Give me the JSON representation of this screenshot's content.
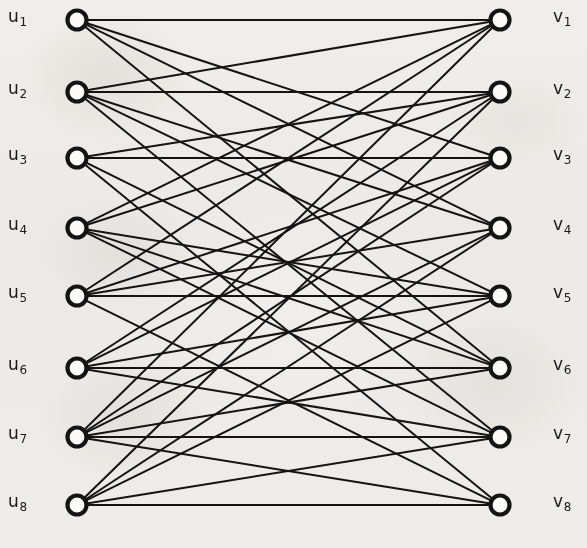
{
  "figure": {
    "kind": "bipartite-graph",
    "background_color": "#f7f6f4",
    "ink_color": "#141414",
    "width": 587,
    "height": 548
  },
  "geometry": {
    "left_column_x": 77,
    "right_column_x": 500,
    "node_radius": 9.5,
    "node_stroke_width": 4.2,
    "edge_stroke_width": 2.0,
    "row_y": [
      20,
      92,
      158,
      228,
      296,
      368,
      437,
      505
    ]
  },
  "left_nodes": [
    {
      "id": "u1",
      "letter": "u",
      "index": "1",
      "label": "u1",
      "x": 77,
      "y": 20,
      "label_x": 8,
      "label_y": 8
    },
    {
      "id": "u2",
      "letter": "u",
      "index": "2",
      "label": "u2",
      "x": 77,
      "y": 92,
      "label_x": 8,
      "label_y": 80
    },
    {
      "id": "u3",
      "letter": "u",
      "index": "3",
      "label": "u3",
      "x": 77,
      "y": 158,
      "label_x": 8,
      "label_y": 146
    },
    {
      "id": "u4",
      "letter": "u",
      "index": "4",
      "label": "u4",
      "x": 77,
      "y": 228,
      "label_x": 8,
      "label_y": 216
    },
    {
      "id": "u5",
      "letter": "u",
      "index": "5",
      "label": "u5",
      "x": 77,
      "y": 296,
      "label_x": 8,
      "label_y": 284
    },
    {
      "id": "u6",
      "letter": "u",
      "index": "6",
      "label": "u6",
      "x": 77,
      "y": 368,
      "label_x": 8,
      "label_y": 356
    },
    {
      "id": "u7",
      "letter": "u",
      "index": "7",
      "label": "u7",
      "x": 77,
      "y": 437,
      "label_x": 8,
      "label_y": 425
    },
    {
      "id": "u8",
      "letter": "u",
      "index": "8",
      "label": "u8",
      "x": 77,
      "y": 505,
      "label_x": 8,
      "label_y": 493
    }
  ],
  "right_nodes": [
    {
      "id": "v1",
      "letter": "v",
      "index": "1",
      "label": "v1",
      "x": 500,
      "y": 20,
      "label_x": 553,
      "label_y": 8
    },
    {
      "id": "v2",
      "letter": "v",
      "index": "2",
      "label": "v2",
      "x": 500,
      "y": 92,
      "label_x": 553,
      "label_y": 80
    },
    {
      "id": "v3",
      "letter": "v",
      "index": "3",
      "label": "v3",
      "x": 500,
      "y": 158,
      "label_x": 553,
      "label_y": 146
    },
    {
      "id": "v4",
      "letter": "v",
      "index": "4",
      "label": "v4",
      "x": 500,
      "y": 228,
      "label_x": 553,
      "label_y": 216
    },
    {
      "id": "v5",
      "letter": "v",
      "index": "5",
      "label": "v5",
      "x": 500,
      "y": 296,
      "label_x": 553,
      "label_y": 284
    },
    {
      "id": "v6",
      "letter": "v",
      "index": "6",
      "label": "v6",
      "x": 500,
      "y": 368,
      "label_x": 553,
      "label_y": 356
    },
    {
      "id": "v7",
      "letter": "v",
      "index": "7",
      "label": "v7",
      "x": 500,
      "y": 437,
      "label_x": 553,
      "label_y": 425
    },
    {
      "id": "v8",
      "letter": "v",
      "index": "8",
      "label": "v8",
      "x": 500,
      "y": 505,
      "label_x": 553,
      "label_y": 493
    }
  ],
  "edges": [
    {
      "from": "u1",
      "to": "v1"
    },
    {
      "from": "u1",
      "to": "v3"
    },
    {
      "from": "u1",
      "to": "v4"
    },
    {
      "from": "u1",
      "to": "v6"
    },
    {
      "from": "u2",
      "to": "v1"
    },
    {
      "from": "u2",
      "to": "v2"
    },
    {
      "from": "u2",
      "to": "v4"
    },
    {
      "from": "u2",
      "to": "v5"
    },
    {
      "from": "u2",
      "to": "v7"
    },
    {
      "from": "u3",
      "to": "v2"
    },
    {
      "from": "u3",
      "to": "v3"
    },
    {
      "from": "u3",
      "to": "v6"
    },
    {
      "from": "u3",
      "to": "v8"
    },
    {
      "from": "u4",
      "to": "v1"
    },
    {
      "from": "u4",
      "to": "v2"
    },
    {
      "from": "u4",
      "to": "v5"
    },
    {
      "from": "u4",
      "to": "v6"
    },
    {
      "from": "u4",
      "to": "v7"
    },
    {
      "from": "u5",
      "to": "v1"
    },
    {
      "from": "u5",
      "to": "v3"
    },
    {
      "from": "u5",
      "to": "v4"
    },
    {
      "from": "u5",
      "to": "v5"
    },
    {
      "from": "u5",
      "to": "v8"
    },
    {
      "from": "u6",
      "to": "v2"
    },
    {
      "from": "u6",
      "to": "v3"
    },
    {
      "from": "u6",
      "to": "v5"
    },
    {
      "from": "u6",
      "to": "v6"
    },
    {
      "from": "u6",
      "to": "v7"
    },
    {
      "from": "u7",
      "to": "v1"
    },
    {
      "from": "u7",
      "to": "v3"
    },
    {
      "from": "u7",
      "to": "v4"
    },
    {
      "from": "u7",
      "to": "v6"
    },
    {
      "from": "u7",
      "to": "v7"
    },
    {
      "from": "u7",
      "to": "v8"
    },
    {
      "from": "u8",
      "to": "v2"
    },
    {
      "from": "u8",
      "to": "v4"
    },
    {
      "from": "u8",
      "to": "v5"
    },
    {
      "from": "u8",
      "to": "v7"
    },
    {
      "from": "u8",
      "to": "v8"
    }
  ]
}
